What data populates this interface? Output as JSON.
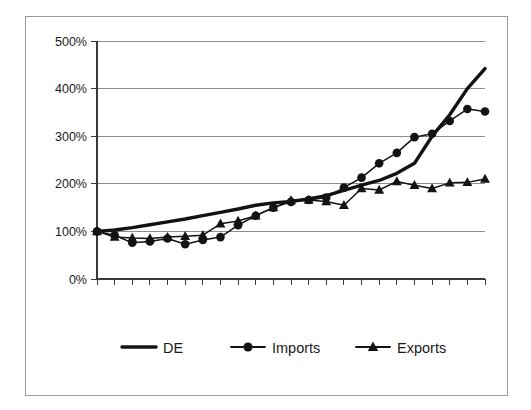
{
  "chart_data": {
    "type": "line",
    "title": "",
    "subtitle": "",
    "xlabel": "",
    "ylabel": "",
    "ylim": [
      0,
      500
    ],
    "xlim": [
      0,
      22
    ],
    "grid": true,
    "grid_axis": "y",
    "legend_position": "bottom",
    "y_unit": "%",
    "y_ticks": [
      0,
      100,
      200,
      300,
      400,
      500
    ],
    "y_tick_labels": [
      "0%",
      "100%",
      "200%",
      "300%",
      "400%",
      "500%"
    ],
    "x_tick_count": 23,
    "x_tick_labels": [],
    "x": [
      0,
      1,
      2,
      3,
      4,
      5,
      6,
      7,
      8,
      9,
      10,
      11,
      12,
      13,
      14,
      15,
      16,
      17,
      18,
      19,
      20,
      21,
      22
    ],
    "series": [
      {
        "name": "DE",
        "marker": "none",
        "line_width": "thick",
        "color": "#131313",
        "values": [
          100,
          103,
          108,
          114,
          120,
          126,
          133,
          140,
          147,
          155,
          160,
          163,
          168,
          175,
          186,
          197,
          207,
          222,
          243,
          300,
          345,
          400,
          442
        ]
      },
      {
        "name": "Imports",
        "marker": "circle",
        "line_width": "thin",
        "color": "#131313",
        "values": [
          100,
          92,
          76,
          79,
          85,
          73,
          82,
          88,
          113,
          133,
          150,
          162,
          166,
          171,
          192,
          213,
          243,
          265,
          298,
          305,
          332,
          357,
          352
        ]
      },
      {
        "name": "Exports",
        "marker": "triangle",
        "line_width": "thin",
        "color": "#131313",
        "values": [
          100,
          88,
          86,
          85,
          88,
          90,
          92,
          116,
          122,
          133,
          150,
          165,
          166,
          163,
          155,
          190,
          187,
          205,
          197,
          190,
          202,
          203,
          210
        ]
      }
    ],
    "legend": [
      {
        "label": "DE",
        "marker": "none",
        "line_width": "thick"
      },
      {
        "label": "Imports",
        "marker": "circle",
        "line_width": "thin"
      },
      {
        "label": "Exports",
        "marker": "triangle",
        "line_width": "thin"
      }
    ],
    "colors": {
      "axis": "#3a3a3a",
      "grid": "#8d8d8d",
      "series": "#131313",
      "frame": "#9a9a9a",
      "background": "#ffffff"
    }
  }
}
